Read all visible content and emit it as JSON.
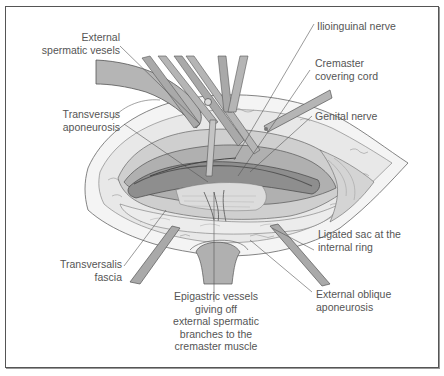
{
  "figure": {
    "type": "surgical anatomical illustration",
    "colors": {
      "background": "#ffffff",
      "border": "#555555",
      "label_text": "#555555",
      "leader_line": "#555555",
      "skin": "#f4f4f4",
      "fat": "#e6e6e6",
      "tissue_light": "#cfcfcf",
      "tissue_mid": "#b0b0b0",
      "tissue_dark": "#8e8e8e",
      "instrument": "#a9a9a9"
    },
    "labels": {
      "external_spermatic_vessels": [
        "External",
        "spermatic vesels"
      ],
      "transversus_aponeurosis": [
        "Transversus",
        "aponeurosis"
      ],
      "transversalis_fascia": [
        "Transversalis",
        "fascia"
      ],
      "ilioinguinal_nerve": [
        "Ilioinguinal nerve"
      ],
      "cremaster_covering_cord": [
        "Cremaster",
        "covering cord"
      ],
      "genital_nerve": [
        "Genital nerve"
      ],
      "ligated_sac": [
        "Ligated sac at the",
        "internal ring"
      ],
      "external_oblique_aponeurosis": [
        "External oblique",
        "aponeurosis"
      ],
      "epigastric_vessels": [
        "Epigastric vessels",
        "giving off",
        "external spermatic",
        "branches to the",
        "cremaster muscle"
      ]
    }
  }
}
